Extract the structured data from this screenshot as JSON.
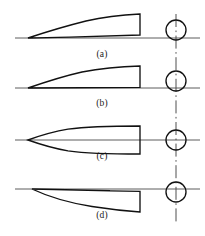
{
  "figure": {
    "type": "technical-line-diagram",
    "background_color": "#ffffff",
    "outline_color": "#111111",
    "axis_color": "#4a4a4a",
    "width": 205,
    "height": 236
  },
  "panels": [
    {
      "id": "a",
      "label": "(a)",
      "label_x": 102,
      "label_y": 50,
      "axis_y": 38,
      "shape": "cambered half-body with blunt trailing edge, thickness above axis",
      "nose_x": 28,
      "tail_x": 140,
      "peak_height": 22,
      "circle_cx": 176,
      "circle_cy": 30,
      "circle_r": 10
    },
    {
      "id": "b",
      "label": "(b)",
      "label_x": 102,
      "label_y": 99,
      "axis_y": 88,
      "shape": "thinner cambered half-body with blunt trailing edge, thickness above axis",
      "nose_x": 28,
      "tail_x": 140,
      "peak_height": 19,
      "circle_cx": 176,
      "circle_cy": 81,
      "circle_r": 10
    },
    {
      "id": "c",
      "label": "(c)",
      "label_x": 102,
      "label_y": 152,
      "axis_y": 140,
      "shape": "symmetric pointed ogive body, thickness above and below axis",
      "nose_x": 28,
      "tail_x": 140,
      "peak_height": 14,
      "circle_cx": 176,
      "circle_cy": 140,
      "circle_r": 10
    },
    {
      "id": "d",
      "label": "(d)",
      "label_x": 102,
      "label_y": 211,
      "axis_y": 189,
      "shape": "inverted cambered half-body with blunt trailing edge, thickness below axis",
      "nose_x": 32,
      "tail_x": 140,
      "peak_height": 22,
      "circle_cx": 176,
      "circle_cy": 192,
      "circle_r": 10
    }
  ],
  "centerline": {
    "name": "vertical-dash-dot-centerline",
    "x": 176,
    "y_top": 14,
    "y_bottom": 224,
    "style": "dash-dot"
  },
  "axes": {
    "x_start": 15,
    "x_end": 200
  }
}
